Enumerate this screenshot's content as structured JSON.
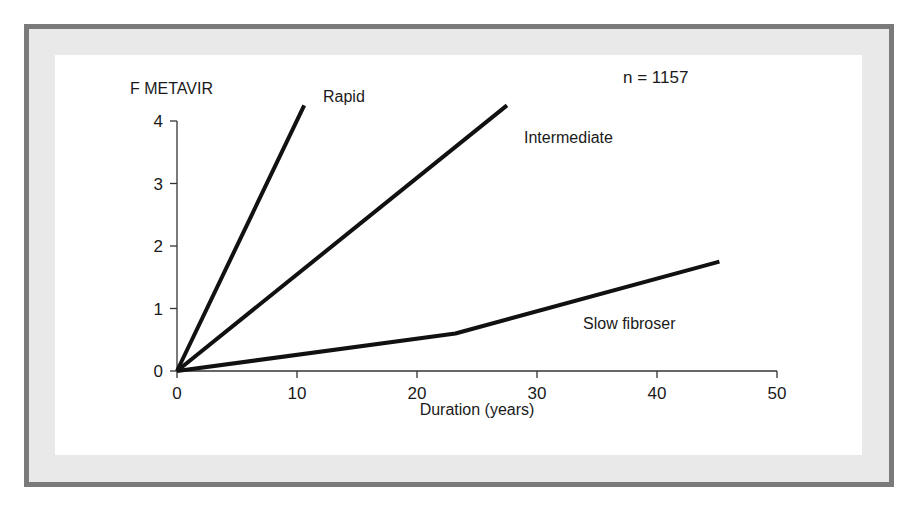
{
  "chart_data": {
    "type": "line",
    "title": "",
    "xlabel": "Duration (years)",
    "ylabel": "F METAVIR",
    "xlim": [
      0,
      50
    ],
    "ylim": [
      0,
      4
    ],
    "x_ticks": [
      0,
      10,
      20,
      30,
      40,
      50
    ],
    "y_ticks": [
      0,
      1,
      2,
      3,
      4
    ],
    "grid": false,
    "legend": "inline labels",
    "annotations": [
      {
        "text": "n = 1157",
        "position": "top-right"
      }
    ],
    "series": [
      {
        "name": "Rapid",
        "x": [
          0,
          10.6
        ],
        "y": [
          0,
          4.25
        ]
      },
      {
        "name": "Intermediate",
        "x": [
          0,
          27.5
        ],
        "y": [
          0,
          4.25
        ]
      },
      {
        "name": "Slow fibroser",
        "x": [
          0,
          23.2,
          45.2
        ],
        "y": [
          0,
          0.6,
          1.75
        ]
      }
    ]
  },
  "labels": {
    "ylabel": "F METAVIR",
    "xlabel": "Duration (years)",
    "n": "n = 1157",
    "rapid": "Rapid",
    "intermediate": "Intermediate",
    "slow": "Slow fibroser"
  },
  "colors": {
    "border": "#7a7a7a",
    "band": "#e9e9e9",
    "line": "#111111"
  }
}
